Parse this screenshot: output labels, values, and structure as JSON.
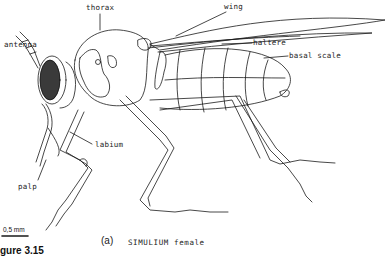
{
  "figure": {
    "subject": "SIMULIUM female",
    "panel": "(a)",
    "caption_text": "SIMULIUM female",
    "figure_number": "gure 3.15",
    "scale_bar": "0,5 mm"
  },
  "labels": {
    "thorax": "thorax",
    "wing": "wing",
    "antenna": "antenna",
    "haltere": "haltere",
    "basal_scale": "basal scale",
    "labium": "labium",
    "palp": "palp"
  },
  "colors": {
    "line": "#1a1a1a",
    "background": "#ffffff"
  }
}
